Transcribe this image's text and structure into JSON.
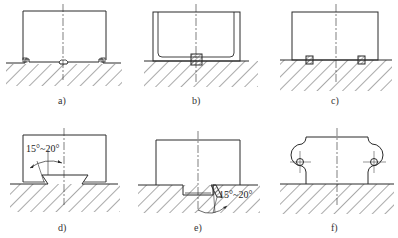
{
  "figure": {
    "panels": [
      {
        "id": "a",
        "label": "a)",
        "description": "Block with small end steps and central V notch on hatched base"
      },
      {
        "id": "b",
        "label": "b)",
        "description": "U-shaped part with rounded inner corners and square key/insert at center on hatched base"
      },
      {
        "id": "c",
        "label": "c)",
        "description": "Block seated on base with two small hatched inserts"
      },
      {
        "id": "d",
        "label": "d)",
        "description": "Block with dovetail-shaped key into base",
        "annotation": "15°~20°"
      },
      {
        "id": "e",
        "label": "e)",
        "description": "Block with recessed groove and inclined wedge in base",
        "annotation": "15°~20°"
      },
      {
        "id": "f",
        "label": "f)",
        "description": "Block with two semicircular lugs having holes, on hatched base"
      }
    ]
  },
  "colors": {
    "line": "#2a2a2a",
    "hatch": "#555555",
    "background": "#ffffff"
  }
}
